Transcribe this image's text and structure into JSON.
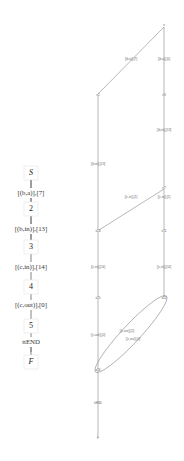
{
  "left_chain": {
    "nodes": [
      "S",
      "2",
      "3",
      "4",
      "5",
      "F"
    ],
    "edges": [
      "[(b,a)],[7]",
      "[(b,in)],[13]",
      "[(c,in)],[14]",
      "[(c,out)],[0]",
      "ttEND"
    ]
  },
  "right_graph": {
    "nodes": {
      "s": "s",
      "s1": "s1",
      "s6": "s6",
      "s7": "s7",
      "s14": "s14",
      "s11": "s11",
      "s15": "s15",
      "s12": "s12",
      "s16": "s16",
      "f": "F"
    },
    "edges": {
      "s_s1": "[(b,a)],[7]",
      "s_s6": "[(b,a)],[0]",
      "s6_s7": "[(b,in)],[13]",
      "s1_s14": "[(b,in)],[13]",
      "s7_s14": "[(c,in)],[1]",
      "s7_s11": "[(c,in)],[1]",
      "s14_s15": "[(c,in)],[14]",
      "s11_s12": "[(c,in)],[14]",
      "s15_s16": "[(c,out)],[0]",
      "s12_s16_a": "[(c,out)],[2]",
      "s12_s16_b": "[(c,out)],[0]",
      "s16_f": "ttEND"
    }
  }
}
